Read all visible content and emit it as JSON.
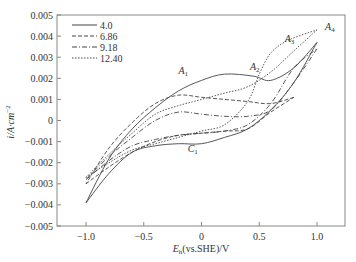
{
  "chart_data": {
    "type": "line",
    "title": "",
    "xlabel": "E_h(vs.SHE)/V",
    "xlabel_main": "E",
    "xlabel_sub": "h",
    "xlabel_rest": "(vs.SHE)/V",
    "ylabel": "i/A·cm^-2",
    "ylabel_main": "i/A·cm",
    "ylabel_sup": "−2",
    "xlim": [
      -1.2,
      1.25
    ],
    "ylim": [
      -0.005,
      0.005
    ],
    "xticks": [
      "−1.0",
      "−0.5",
      "0",
      "0.5",
      "1.0"
    ],
    "xtick_values": [
      -1.0,
      -0.5,
      0,
      0.5,
      1.0
    ],
    "yticks": [
      "0.005",
      "0.004",
      "0.003",
      "0.002",
      "0.001",
      "0",
      "−0.001",
      "−0.002",
      "−0.003",
      "−0.004",
      "−0.005"
    ],
    "ytick_values": [
      0.005,
      0.004,
      0.003,
      0.002,
      0.001,
      0,
      -0.001,
      -0.002,
      -0.003,
      -0.004,
      -0.005
    ],
    "grid": false,
    "legend_position": "upper left",
    "legend": [
      "4.0",
      "6.86",
      "9.18",
      "12.40"
    ],
    "annotations": [
      {
        "label": "A",
        "sub": "1",
        "x": -0.2,
        "y": 0.0022
      },
      {
        "label": "A",
        "sub": "2",
        "x": 0.42,
        "y": 0.0024
      },
      {
        "label": "A",
        "sub": "3",
        "x": 0.72,
        "y": 0.0037
      },
      {
        "label": "A",
        "sub": "4",
        "x": 1.07,
        "y": 0.0043
      },
      {
        "label": "C",
        "sub": "1",
        "x": -0.12,
        "y": -0.0015
      }
    ],
    "series": [
      {
        "name": "4.0",
        "style": "solid",
        "forward": [
          [
            -1.0,
            -0.0039
          ],
          [
            -0.8,
            -0.0025
          ],
          [
            -0.6,
            -0.0015
          ],
          [
            -0.4,
            -0.0012
          ],
          [
            -0.2,
            -0.0011
          ],
          [
            0.0,
            -0.0011
          ],
          [
            0.2,
            -0.0008
          ],
          [
            0.4,
            -0.0004
          ],
          [
            0.6,
            0.0005
          ],
          [
            0.8,
            0.0018
          ],
          [
            1.0,
            0.0037
          ]
        ],
        "reverse": [
          [
            1.0,
            0.0037
          ],
          [
            0.8,
            0.0025
          ],
          [
            0.6,
            0.0019
          ],
          [
            0.45,
            0.0021
          ],
          [
            0.2,
            0.0022
          ],
          [
            0.0,
            0.0019
          ],
          [
            -0.2,
            0.0014
          ],
          [
            -0.4,
            0.0006
          ],
          [
            -0.6,
            -0.0004
          ],
          [
            -0.8,
            -0.0018
          ],
          [
            -1.0,
            -0.0039
          ]
        ]
      },
      {
        "name": "6.86",
        "style": "dashed",
        "forward": [
          [
            -1.0,
            -0.003
          ],
          [
            -0.8,
            -0.0022
          ],
          [
            -0.6,
            -0.0015
          ],
          [
            -0.4,
            -0.001
          ],
          [
            -0.2,
            -0.0007
          ],
          [
            0.0,
            -0.0006
          ],
          [
            0.2,
            -0.0005
          ],
          [
            0.4,
            -0.0004
          ],
          [
            0.6,
            0.0004
          ],
          [
            0.8,
            0.0011
          ]
        ],
        "reverse": [
          [
            0.8,
            0.0011
          ],
          [
            0.6,
            0.0008
          ],
          [
            0.4,
            0.0009
          ],
          [
            0.2,
            0.001
          ],
          [
            0.0,
            0.0011
          ],
          [
            -0.2,
            0.0012
          ],
          [
            -0.4,
            0.0008
          ],
          [
            -0.6,
            -0.0001
          ],
          [
            -0.8,
            -0.0013
          ],
          [
            -1.0,
            -0.003
          ]
        ]
      },
      {
        "name": "9.18",
        "style": "dashdot",
        "forward": [
          [
            -1.0,
            -0.0028
          ],
          [
            -0.8,
            -0.0019
          ],
          [
            -0.6,
            -0.0012
          ],
          [
            -0.4,
            -0.0009
          ],
          [
            -0.2,
            -0.0007
          ],
          [
            0.0,
            -0.0006
          ],
          [
            0.2,
            -0.0005
          ],
          [
            0.4,
            -0.0002
          ],
          [
            0.6,
            0.0008
          ],
          [
            0.8,
            0.0025
          ],
          [
            1.0,
            0.0034
          ]
        ],
        "reverse": [
          [
            1.0,
            0.0034
          ],
          [
            0.8,
            0.0018
          ],
          [
            0.6,
            0.0005
          ],
          [
            0.4,
            0.0002
          ],
          [
            0.2,
            0.0002
          ],
          [
            0.0,
            0.0003
          ],
          [
            -0.2,
            0.0004
          ],
          [
            -0.4,
            0.0
          ],
          [
            -0.6,
            -0.0008
          ],
          [
            -0.8,
            -0.0017
          ],
          [
            -1.0,
            -0.0028
          ]
        ]
      },
      {
        "name": "12.40",
        "style": "dotted",
        "forward": [
          [
            -1.0,
            -0.0027
          ],
          [
            -0.8,
            -0.002
          ],
          [
            -0.6,
            -0.0014
          ],
          [
            -0.4,
            -0.0011
          ],
          [
            -0.2,
            -0.0008
          ],
          [
            0.0,
            -0.0005
          ],
          [
            0.2,
            -0.0002
          ],
          [
            0.4,
            0.0009
          ],
          [
            0.5,
            0.0022
          ],
          [
            0.6,
            0.0032
          ],
          [
            0.75,
            0.0038
          ],
          [
            1.0,
            0.0043
          ]
        ],
        "reverse": [
          [
            1.0,
            0.0043
          ],
          [
            0.8,
            0.0033
          ],
          [
            0.6,
            0.0023
          ],
          [
            0.4,
            0.0016
          ],
          [
            0.2,
            0.0013
          ],
          [
            0.0,
            0.001
          ],
          [
            -0.2,
            0.0007
          ],
          [
            -0.4,
            0.0003
          ],
          [
            -0.6,
            -0.0006
          ],
          [
            -0.8,
            -0.0016
          ],
          [
            -1.0,
            -0.0027
          ]
        ]
      }
    ]
  }
}
